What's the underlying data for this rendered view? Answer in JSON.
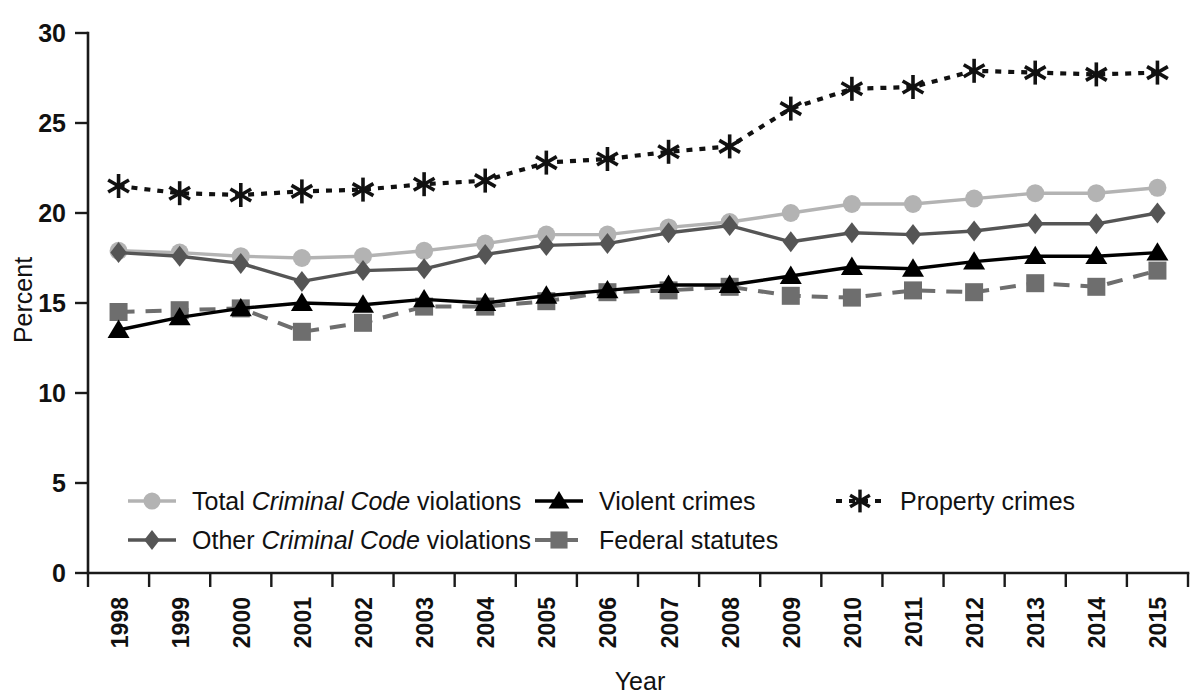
{
  "chart_data": {
    "type": "line",
    "title": "",
    "xlabel": "Year",
    "ylabel": "Percent",
    "ylim": [
      0,
      30
    ],
    "yticks": [
      0,
      5,
      10,
      15,
      20,
      25,
      30
    ],
    "grid": false,
    "legend_position": "inside-bottom-left",
    "categories": [
      "1998",
      "1999",
      "2000",
      "2001",
      "2002",
      "2003",
      "2004",
      "2005",
      "2006",
      "2007",
      "2008",
      "2009",
      "2010",
      "2011",
      "2012",
      "2013",
      "2014",
      "2015"
    ],
    "series": [
      {
        "name": "Total Criminal Code violations",
        "name_plain": "Total ",
        "name_italic": "Criminal Code",
        "name_tail": " violations",
        "marker": "circle",
        "linestyle": "solid",
        "color": "#b3b3b3",
        "values": [
          17.9,
          17.8,
          17.6,
          17.5,
          17.6,
          17.9,
          18.3,
          18.8,
          18.8,
          19.2,
          19.5,
          20.0,
          20.5,
          20.5,
          20.8,
          21.1,
          21.1,
          21.4
        ]
      },
      {
        "name": "Other Criminal Code violations",
        "name_plain": "Other ",
        "name_italic": "Criminal Code",
        "name_tail": " violations",
        "marker": "diamond",
        "linestyle": "solid",
        "color": "#555555",
        "values": [
          17.8,
          17.6,
          17.2,
          16.2,
          16.8,
          16.9,
          17.7,
          18.2,
          18.3,
          18.9,
          19.3,
          18.4,
          18.9,
          18.8,
          19.0,
          19.4,
          19.4,
          20.0
        ]
      },
      {
        "name": "Violent crimes",
        "name_plain": "Violent crimes",
        "name_italic": "",
        "name_tail": "",
        "marker": "triangle",
        "linestyle": "solid",
        "color": "#000000",
        "values": [
          13.5,
          14.2,
          14.7,
          15.0,
          14.9,
          15.2,
          15.0,
          15.4,
          15.7,
          16.0,
          16.0,
          16.5,
          17.0,
          16.9,
          17.3,
          17.6,
          17.6,
          17.8
        ]
      },
      {
        "name": "Federal statutes",
        "name_plain": "Federal statutes",
        "name_italic": "",
        "name_tail": "",
        "marker": "square",
        "linestyle": "dashed",
        "color": "#6e6e6e",
        "values": [
          14.5,
          14.6,
          14.7,
          13.4,
          13.9,
          14.8,
          14.8,
          15.1,
          15.6,
          15.7,
          15.9,
          15.4,
          15.3,
          15.7,
          15.6,
          16.1,
          15.9,
          16.8
        ]
      },
      {
        "name": "Property crimes",
        "name_plain": "Property crimes",
        "name_italic": "",
        "name_tail": "",
        "marker": "asterisk",
        "linestyle": "dotted",
        "color": "#111111",
        "values": [
          21.5,
          21.1,
          21.0,
          21.2,
          21.3,
          21.6,
          21.8,
          22.8,
          23.0,
          23.4,
          23.7,
          25.8,
          26.9,
          27.0,
          27.9,
          27.8,
          27.7,
          27.8
        ]
      }
    ]
  },
  "legend": {
    "items": [
      {
        "label_plain": "Total ",
        "label_italic": "Criminal Code",
        "label_tail": " violations"
      },
      {
        "label_plain": "Other ",
        "label_italic": "Criminal Code",
        "label_tail": " violations"
      },
      {
        "label_plain": "Violent crimes",
        "label_italic": "",
        "label_tail": ""
      },
      {
        "label_plain": "Federal statutes",
        "label_italic": "",
        "label_tail": ""
      },
      {
        "label_plain": "Property crimes",
        "label_italic": "",
        "label_tail": ""
      }
    ]
  }
}
